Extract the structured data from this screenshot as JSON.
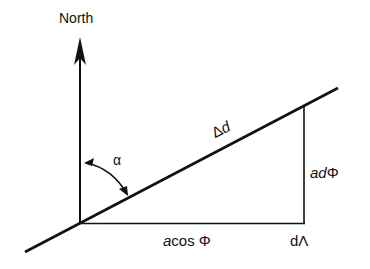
{
  "diagram": {
    "labels": {
      "north": "North",
      "alpha": "α",
      "delta": "Δ",
      "d_italic": "d",
      "a_italic": "a",
      "d_phi_prefix": "d",
      "phi": "Φ",
      "cos_phi": "cos Φ",
      "d_lambda": "dΛ"
    },
    "colors": {
      "line": "#111111",
      "background": "#ffffff"
    },
    "geometry": {
      "origin": [
        80,
        223
      ],
      "diagonal_start": [
        25,
        252
      ],
      "diagonal_end": [
        338,
        88
      ],
      "north_arrow_tip": [
        80,
        37
      ],
      "right_angle_corner": [
        304,
        223
      ],
      "vertical_top": [
        304,
        108
      ]
    }
  }
}
